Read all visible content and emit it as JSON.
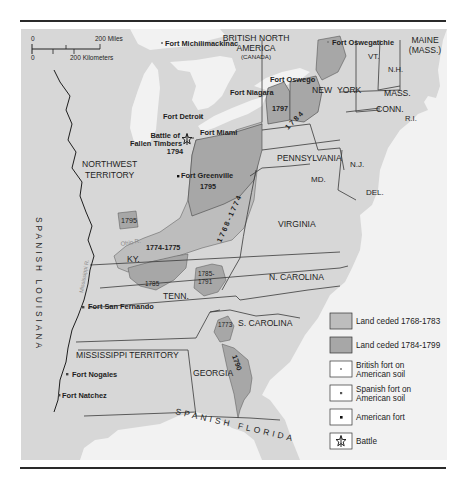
{
  "map": {
    "colors": {
      "background_land": "#d7d7d7",
      "water": "#f2f2f2",
      "ceded_1768_1783": "#bdbdbd",
      "ceded_1784_1799": "#a7a7a7",
      "border": "#3a3a3a",
      "legend_box_fill": "#ffffff"
    },
    "scale_bar": {
      "zero_top": "0",
      "miles_label": "200 Miles",
      "zero_bottom": "0",
      "km_label": "200 Kilometers"
    },
    "regions": {
      "british_north_america": "BRITISH NORTH",
      "british_north_america_2": "AMERICA",
      "canada": "(CANADA)",
      "maine": "MAINE",
      "maine_mass": "(MASS.)",
      "vermont": "VT.",
      "new_hampshire": "N.H.",
      "massachusetts": "MASS.",
      "connecticut": "CONN.",
      "rhode_island": "R.I.",
      "new_york_1": "NEW",
      "new_york_2": "YORK",
      "pennsylvania": "PENNSYLVANIA",
      "new_jersey": "N.J.",
      "maryland": "MD.",
      "delaware": "DEL.",
      "virginia": "VIRGINIA",
      "north_carolina": "N. CAROLINA",
      "south_carolina": "S. CAROLINA",
      "georgia": "GEORGIA",
      "tennessee": "TENN.",
      "kentucky": "KY.",
      "northwest_territory_1": "NORTHWEST",
      "northwest_territory_2": "TERRITORY",
      "mississippi_territory": "MISSISSIPPI TERRITORY",
      "spanish_louisiana": "SPANISH LOUISIANA",
      "spanish_florida": "SPANISH FLORIDA",
      "ohio_river": "Ohio R.",
      "mississippi_river": "Mississippi R."
    },
    "forts": {
      "michilimackinac": "Fort Michilimackinac",
      "oswegatchie": "Fort Oswegatchie",
      "oswego": "Fort Oswego",
      "niagara": "Fort Niagara",
      "detroit": "Fort Detroit",
      "miami": "Fort Miami",
      "greenville": "Fort Greenville",
      "san_fernando": "Fort San Fernando",
      "nogales": "Fort Nogales",
      "natchez": "Fort Natchez"
    },
    "battle": {
      "line1": "Battle of",
      "line2": "Fallen Timbers",
      "year": "1794"
    },
    "cession_years": {
      "ny_1797": "1797",
      "ny_1784": "1 7 8 4",
      "ohio_1795": "1795",
      "illinois_1795": "1795",
      "line_1768_1774": "1 7 6 8 - 1 7 7 4",
      "ky_1774_1775": "1774-1775",
      "tenn_1785": "1785",
      "tenn_1785_1791_a": "1785-",
      "tenn_1785_1791_b": "1791",
      "sc_1773": "1773",
      "ga_1790": "1790"
    },
    "legend": {
      "items": [
        {
          "label": "Land ceded 1768-1783",
          "label2": "",
          "symbol": "swatch-light"
        },
        {
          "label": "Land ceded 1784-1799",
          "label2": "",
          "symbol": "swatch-dark"
        },
        {
          "label": "British fort on",
          "label2": "American soil",
          "symbol": "british-fort-icon"
        },
        {
          "label": "Spanish fort on",
          "label2": "American soil",
          "symbol": "spanish-fort-icon"
        },
        {
          "label": "American fort",
          "label2": "",
          "symbol": "american-fort-icon"
        },
        {
          "label": "Battle",
          "label2": "",
          "symbol": "battle-icon"
        }
      ]
    }
  }
}
